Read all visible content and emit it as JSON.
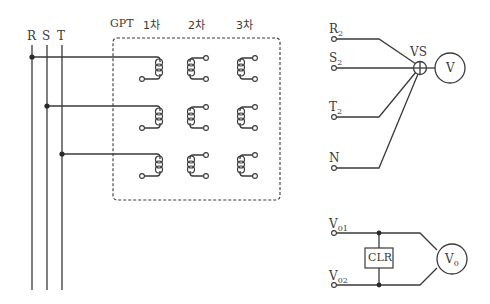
{
  "diagram": {
    "bus_labels": {
      "r": "R",
      "s": "S",
      "t": "T"
    },
    "gpt": {
      "label": "GPT",
      "columns": [
        "1차",
        "2차",
        "3차"
      ]
    },
    "vs_circuit": {
      "terminals": [
        {
          "main": "R",
          "sub": "2"
        },
        {
          "main": "S",
          "sub": "2"
        },
        {
          "main": "T",
          "sub": "2"
        },
        {
          "main": "N",
          "sub": ""
        }
      ],
      "switch_label": "VS",
      "meter_label": "V"
    },
    "clr_circuit": {
      "terminals": [
        {
          "main": "V",
          "sub": "01"
        },
        {
          "main": "V",
          "sub": "02"
        }
      ],
      "resistor_label": "CLR",
      "meter_main": "V",
      "meter_sub": "0"
    },
    "colors": {
      "line": "#3a3a3a",
      "background": "#ffffff"
    }
  }
}
